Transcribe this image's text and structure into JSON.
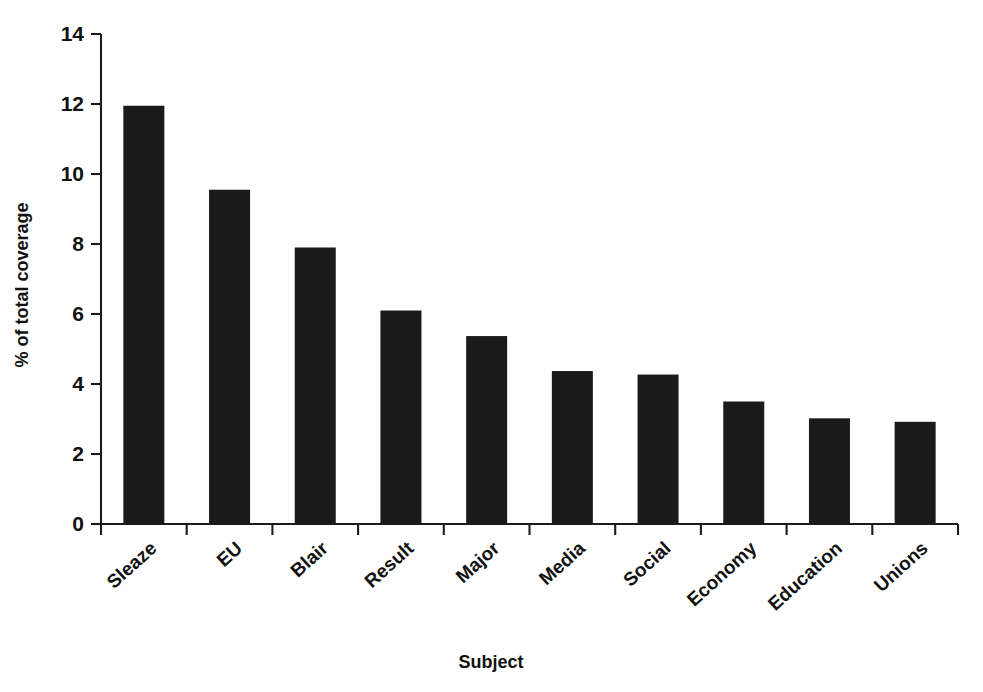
{
  "chart_data": {
    "type": "bar",
    "title": "",
    "xlabel": "Subject",
    "ylabel": "% of total coverage",
    "categories": [
      "Sleaze",
      "EU",
      "Blair",
      "Result",
      "Major",
      "Media",
      "Social",
      "Economy",
      "Education",
      "Unions"
    ],
    "values": [
      11.95,
      9.55,
      7.9,
      6.1,
      5.37,
      4.37,
      4.27,
      3.5,
      3.02,
      2.92
    ],
    "ylim": [
      0,
      14
    ],
    "ytick_labels": [
      "0",
      "2",
      "4",
      "6",
      "8",
      "10",
      "12",
      "14"
    ],
    "ytick_values": [
      0,
      2,
      4,
      6,
      8,
      10,
      12,
      14
    ],
    "grid": false,
    "legend": false,
    "legend_position": "none",
    "bar_color": "#1a1a1a",
    "axis_color": "#1b1b1b",
    "background_color": "#ffffff",
    "xtick_label_rotation": -42
  },
  "axis": {
    "y_title": "% of total coverage",
    "x_title": "Subject"
  }
}
